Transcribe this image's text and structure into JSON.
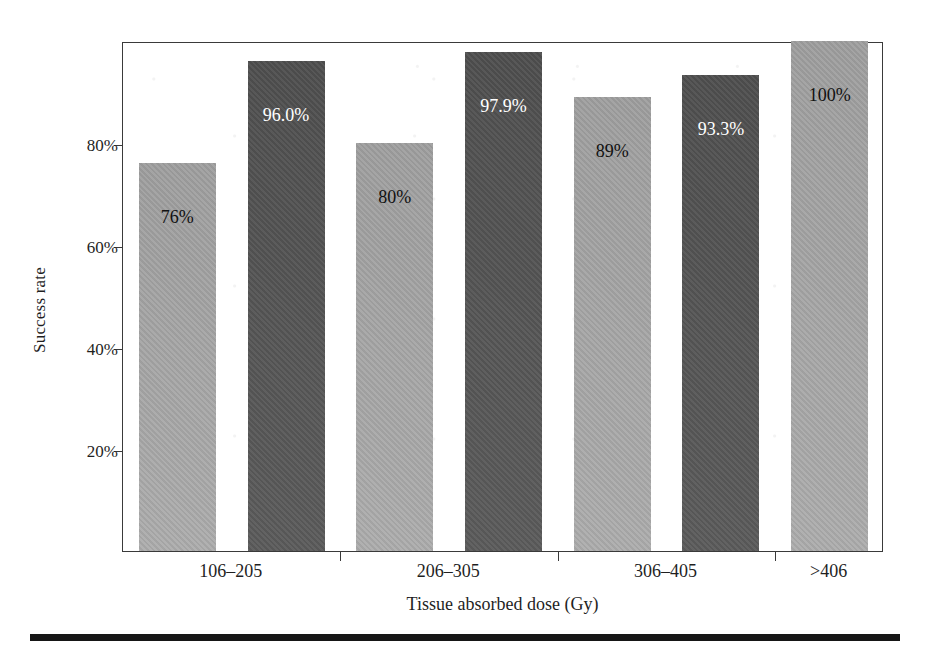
{
  "chart_data": {
    "type": "bar",
    "title": "",
    "xlabel": "Tissue absorbed dose (Gy)",
    "ylabel": "Success rate",
    "categories": [
      "106–205",
      "206–305",
      "306–405",
      ">406"
    ],
    "ylim": [
      0,
      100
    ],
    "ytick_values": [
      20,
      40,
      60,
      80
    ],
    "ytick_labels": [
      "20%",
      "40%",
      "60%",
      "80%"
    ],
    "grid": false,
    "legend": "none",
    "series": [
      {
        "name": "light",
        "color": "#a8a8a8",
        "values": [
          76,
          80,
          89,
          100
        ],
        "labels": [
          "76%",
          "80%",
          "89%",
          "100%"
        ]
      },
      {
        "name": "dark",
        "color": "#545454",
        "values": [
          96.0,
          97.9,
          93.3,
          null
        ],
        "labels": [
          "96.0%",
          "97.9%",
          "93.3%",
          null
        ]
      }
    ],
    "bars": [
      {
        "category": "106–205",
        "shade": "light",
        "value": 76,
        "label": "76%",
        "label_color": "#111111"
      },
      {
        "category": "106–205",
        "shade": "dark",
        "value": 96.0,
        "label": "96.0%",
        "label_color": "#ffffff"
      },
      {
        "category": "206–305",
        "shade": "light",
        "value": 80,
        "label": "80%",
        "label_color": "#111111"
      },
      {
        "category": "206–305",
        "shade": "dark",
        "value": 97.9,
        "label": "97.9%",
        "label_color": "#ffffff"
      },
      {
        "category": "306–405",
        "shade": "light",
        "value": 89,
        "label": "89%",
        "label_color": "#111111"
      },
      {
        "category": "306–405",
        "shade": "dark",
        "value": 93.3,
        "label": "93.3%",
        "label_color": "#ffffff"
      },
      {
        "category": ">406",
        "shade": "light",
        "value": 100,
        "label": "100%",
        "label_color": "#111111"
      }
    ]
  },
  "colors": {
    "light_bar": "#a8a8a8",
    "dark_bar": "#545454",
    "axis": "#3a3a3a",
    "text": "#1f1f1f",
    "rule": "#161616",
    "background": "#ffffff"
  }
}
